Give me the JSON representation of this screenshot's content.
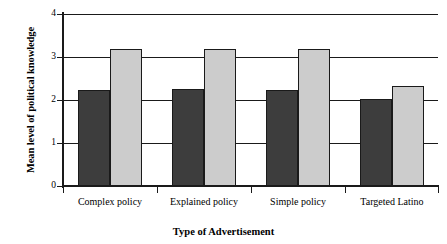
{
  "chart_data": {
    "type": "bar",
    "title": "",
    "xlabel": "Type of Advertisement",
    "ylabel": "Mean level of political knowledge",
    "categories": [
      "Complex policy",
      "Explained policy",
      "Simple policy",
      "Targeted Latino"
    ],
    "series": [
      {
        "name": "series-dark",
        "color": "#3d3d3d",
        "values": [
          2.24,
          2.25,
          2.24,
          2.02
        ]
      },
      {
        "name": "series-light",
        "color": "#cccccc",
        "values": [
          3.19,
          3.19,
          3.18,
          2.32
        ]
      }
    ],
    "ylim": [
      0,
      4
    ],
    "yticks": [
      "0",
      "1",
      "2",
      "3",
      "4"
    ],
    "ytick_values": [
      0,
      1,
      2,
      3,
      4
    ],
    "grid": "horizontal",
    "legend": "none"
  },
  "axis": {
    "y_title": "Mean level of political knowledge",
    "x_title": "Type of Advertisement"
  }
}
